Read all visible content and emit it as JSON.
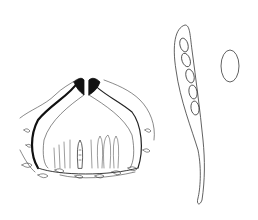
{
  "figure": {
    "background": "#ffffff",
    "ink": "#3a3a3a",
    "dark_ink": "#111111",
    "elements": [
      {
        "id": "perithecium",
        "description": "sectioned flask-shaped perithecium embedded in substrate"
      },
      {
        "id": "ascus",
        "description": "clavate ascus with stalk containing ellipsoid ascospores"
      },
      {
        "id": "ascospore",
        "description": "single ellipsoid ascospore"
      }
    ]
  }
}
